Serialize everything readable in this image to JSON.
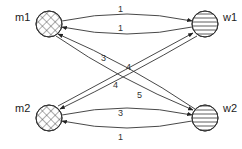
{
  "diagram": {
    "type": "bipartite-directed-graph",
    "nodes": [
      {
        "id": "m1",
        "label": "m1",
        "fill": "crosshatch",
        "side": "left",
        "row": "top"
      },
      {
        "id": "w1",
        "label": "w1",
        "fill": "horizontal-stripes",
        "side": "right",
        "row": "top"
      },
      {
        "id": "m2",
        "label": "m2",
        "fill": "crosshatch",
        "side": "left",
        "row": "bottom"
      },
      {
        "id": "w2",
        "label": "w2",
        "fill": "horizontal-stripes",
        "side": "right",
        "row": "bottom"
      }
    ],
    "edges": [
      {
        "from": "m1",
        "to": "w1",
        "label": "1"
      },
      {
        "from": "w1",
        "to": "m1",
        "label": "1"
      },
      {
        "from": "w2",
        "to": "m1",
        "label": "3"
      },
      {
        "from": "m2",
        "to": "w1",
        "label": "4"
      },
      {
        "from": "w1",
        "to": "m2",
        "label": "4"
      },
      {
        "from": "m1",
        "to": "w2",
        "label": "5"
      },
      {
        "from": "m2",
        "to": "w2",
        "label": "3"
      },
      {
        "from": "w2",
        "to": "m2",
        "label": "1"
      }
    ],
    "colors": {
      "stroke": "#333333",
      "background": "#ffffff"
    }
  }
}
